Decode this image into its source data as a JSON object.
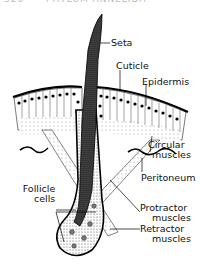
{
  "header": {
    "page_number": "326",
    "running_title": "PHYLUM ANNELIDA"
  },
  "diagram": {
    "labels": {
      "seta": "Seta",
      "cuticle": "Cuticle",
      "epidermis": "Epidermis",
      "circular_muscles_1": "Circular",
      "circular_muscles_2": "muscles",
      "peritoneum": "Peritoneum",
      "follicle_cells_1": "Follicle",
      "follicle_cells_2": "cells",
      "protractor_muscles_1": "Protractor",
      "protractor_muscles_2": "muscles",
      "retractor_muscles_1": "Retractor",
      "retractor_muscles_2": "muscles"
    },
    "colors": {
      "ink": "#111111",
      "stipple": "#555555",
      "background": "#ffffff"
    }
  }
}
